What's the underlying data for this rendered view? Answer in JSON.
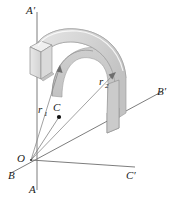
{
  "figure": {
    "background_color": "#ffffff",
    "width": 174,
    "height": 198
  },
  "labels": {
    "a_prime": "A′",
    "a": "A",
    "b": "B",
    "b_prime": "B′",
    "c": "C",
    "c_prime": "C′",
    "o": "O",
    "r1_base": "r",
    "r1_sub": "1",
    "r2_base": "r",
    "r2_sub": "2"
  },
  "colors": {
    "outline": "#8d8d8d",
    "axis": "#6e6e6e",
    "radius": "#8a8a8a",
    "label_text": "#1a1a1a",
    "solid_top_light": "#f2f2f2",
    "solid_top_mid": "#e3e3e3",
    "solid_outer_face": "#d0d0d0",
    "solid_inner_face": "#c4c4c4",
    "solid_end_face": "#dcdcdc",
    "solid_end_face_dark": "#cccccc",
    "solid_shadow": "#b6b6b6"
  },
  "geometry": {
    "origin_point": {
      "x": 31,
      "y": 160
    },
    "center_point": {
      "x": 59,
      "y": 116
    },
    "axis_aa_prime": {
      "x1": 37,
      "y1": 12,
      "x2": 37,
      "y2": 190
    },
    "axis_bb_prime": {
      "x1": 12,
      "y1": 172,
      "x2": 162,
      "y2": 92
    },
    "axis_cc_prime": {
      "x1": 31,
      "y1": 160,
      "x2": 134,
      "y2": 166
    },
    "radius_r1": {
      "x1": 31,
      "y1": 160,
      "x2": 59,
      "y2": 67
    },
    "radius_r2": {
      "x1": 31,
      "y1": 160,
      "x2": 114,
      "y2": 75
    }
  },
  "annotations": {
    "r1_position": {
      "x": 40,
      "y": 112
    },
    "r2_position": {
      "x": 101,
      "y": 84
    },
    "c_position": {
      "x": 54,
      "y": 110
    },
    "o_position": {
      "x": 21,
      "y": 159
    },
    "a_position": {
      "x": 29,
      "y": 191
    },
    "b_position": {
      "x": 10,
      "y": 175
    },
    "a_prime_position": {
      "x": 26,
      "y": 13
    },
    "b_prime_position": {
      "x": 158,
      "y": 95
    },
    "c_prime_position": {
      "x": 127,
      "y": 177
    }
  }
}
